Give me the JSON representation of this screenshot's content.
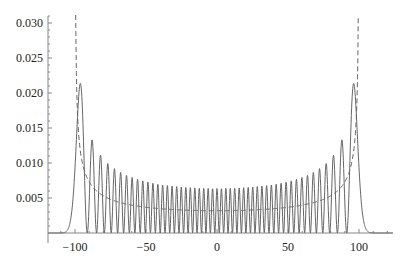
{
  "chart_data": {
    "type": "line",
    "title": "",
    "xlabel": "",
    "ylabel": "",
    "xlim": [
      -119,
      124
    ],
    "ylim": [
      0,
      0.031
    ],
    "grid": false,
    "legend": null,
    "x_ticks": [
      -100,
      -50,
      0,
      50,
      100
    ],
    "x_tick_labels": [
      "−100",
      "−50",
      "0",
      "50",
      "100"
    ],
    "y_ticks": [
      0.005,
      0.01,
      0.015,
      0.02,
      0.025,
      0.03
    ],
    "y_tick_labels": [
      "0.005",
      "0.010",
      "0.015",
      "0.020",
      "0.025",
      "0.030"
    ],
    "series": [
      {
        "name": "quantum probability density",
        "style": "solid",
        "color": "#666666",
        "model": "harmonic-oscillator eigenstate |psi_n(x)|^2",
        "n": 50,
        "classical_turning_point": 100,
        "key_points": [
          {
            "x": -96,
            "y": 0.0211
          },
          {
            "x": -88,
            "y": 0.0133
          },
          {
            "x": -82,
            "y": 0.0107
          },
          {
            "x": -75,
            "y": 0.0092
          },
          {
            "x": 0,
            "y": 0.0059
          },
          {
            "x": 75,
            "y": 0.0092
          },
          {
            "x": 82,
            "y": 0.0107
          },
          {
            "x": 88,
            "y": 0.0133
          },
          {
            "x": 96,
            "y": 0.0211
          }
        ]
      },
      {
        "name": "classical probability density",
        "style": "dashed",
        "color": "#666666",
        "model": "1/(pi*sqrt(A^2 - x^2))",
        "A": 100,
        "key_points": [
          {
            "x": -99.5,
            "y": 0.03
          },
          {
            "x": -90,
            "y": 0.0073
          },
          {
            "x": -50,
            "y": 0.0037
          },
          {
            "x": 0,
            "y": 0.0032
          },
          {
            "x": 50,
            "y": 0.0037
          },
          {
            "x": 90,
            "y": 0.0073
          },
          {
            "x": 99.5,
            "y": 0.03
          }
        ]
      }
    ]
  },
  "layout": {
    "plot_left_px": 48,
    "plot_right_px": 393,
    "x_origin_px": 217,
    "x_scale_px_per_unit": 1.42,
    "y_zero_px": 233,
    "y_scale_px_per_unit": 7000
  }
}
